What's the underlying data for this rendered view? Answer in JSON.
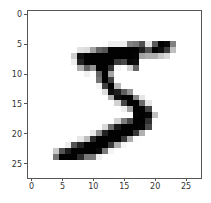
{
  "chart_data": {
    "type": "heatmap",
    "title": "",
    "xlabel": "",
    "ylabel": "",
    "colormap": "gray_r",
    "xlim": [
      -0.5,
      27.5
    ],
    "ylim": [
      27.5,
      -0.5
    ],
    "xticks": [
      0,
      5,
      10,
      15,
      20,
      25
    ],
    "yticks": [
      0,
      5,
      10,
      15,
      20,
      25
    ],
    "xtick_labels": [
      "0",
      "5",
      "10",
      "15",
      "20",
      "25"
    ],
    "ytick_labels": [
      "0",
      "5",
      "10",
      "15",
      "20",
      "25"
    ],
    "grid": false,
    "legend": null,
    "rows": 28,
    "cols": 28,
    "pixels": [
      [
        0,
        0,
        0,
        0,
        0,
        0,
        0,
        0,
        0,
        0,
        0,
        0,
        0,
        0,
        0,
        0,
        0,
        0,
        0,
        0,
        0,
        0,
        0,
        0,
        0,
        0,
        0,
        0
      ],
      [
        0,
        0,
        0,
        0,
        0,
        0,
        0,
        0,
        0,
        0,
        0,
        0,
        0,
        0,
        0,
        0,
        0,
        0,
        0,
        0,
        0,
        0,
        0,
        0,
        0,
        0,
        0,
        0
      ],
      [
        0,
        0,
        0,
        0,
        0,
        0,
        0,
        0,
        0,
        0,
        0,
        0,
        0,
        0,
        0,
        0,
        0,
        0,
        0,
        0,
        0,
        0,
        0,
        0,
        0,
        0,
        0,
        0
      ],
      [
        0,
        0,
        0,
        0,
        0,
        0,
        0,
        0,
        0,
        0,
        0,
        0,
        0,
        0,
        0,
        0,
        0,
        0,
        0,
        0,
        0,
        0,
        0,
        0,
        0,
        0,
        0,
        0
      ],
      [
        0,
        0,
        0,
        0,
        0,
        0,
        0,
        0,
        0,
        0,
        0,
        0,
        0,
        0,
        0,
        0,
        0,
        0,
        0,
        0,
        0,
        0,
        0,
        0,
        0,
        0,
        0,
        0
      ],
      [
        0,
        0,
        0,
        0,
        0,
        0,
        0,
        0,
        0,
        0,
        0,
        0,
        3,
        18,
        18,
        18,
        126,
        136,
        175,
        26,
        166,
        255,
        247,
        127,
        0,
        0,
        0,
        0
      ],
      [
        0,
        0,
        0,
        0,
        0,
        0,
        0,
        0,
        30,
        36,
        94,
        154,
        170,
        253,
        253,
        253,
        253,
        253,
        225,
        172,
        253,
        242,
        195,
        64,
        0,
        0,
        0,
        0
      ],
      [
        0,
        0,
        0,
        0,
        0,
        0,
        0,
        49,
        238,
        253,
        253,
        253,
        253,
        253,
        253,
        253,
        253,
        251,
        93,
        82,
        82,
        56,
        39,
        0,
        0,
        0,
        0,
        0
      ],
      [
        0,
        0,
        0,
        0,
        0,
        0,
        0,
        18,
        219,
        253,
        253,
        253,
        253,
        253,
        198,
        182,
        247,
        241,
        0,
        0,
        0,
        0,
        0,
        0,
        0,
        0,
        0,
        0
      ],
      [
        0,
        0,
        0,
        0,
        0,
        0,
        0,
        0,
        80,
        156,
        107,
        253,
        253,
        205,
        11,
        0,
        43,
        154,
        0,
        0,
        0,
        0,
        0,
        0,
        0,
        0,
        0,
        0
      ],
      [
        0,
        0,
        0,
        0,
        0,
        0,
        0,
        0,
        0,
        14,
        1,
        154,
        253,
        90,
        0,
        0,
        0,
        0,
        0,
        0,
        0,
        0,
        0,
        0,
        0,
        0,
        0,
        0
      ],
      [
        0,
        0,
        0,
        0,
        0,
        0,
        0,
        0,
        0,
        0,
        0,
        139,
        253,
        190,
        2,
        0,
        0,
        0,
        0,
        0,
        0,
        0,
        0,
        0,
        0,
        0,
        0,
        0
      ],
      [
        0,
        0,
        0,
        0,
        0,
        0,
        0,
        0,
        0,
        0,
        0,
        11,
        190,
        253,
        70,
        0,
        0,
        0,
        0,
        0,
        0,
        0,
        0,
        0,
        0,
        0,
        0,
        0
      ],
      [
        0,
        0,
        0,
        0,
        0,
        0,
        0,
        0,
        0,
        0,
        0,
        0,
        35,
        241,
        225,
        160,
        108,
        1,
        0,
        0,
        0,
        0,
        0,
        0,
        0,
        0,
        0,
        0
      ],
      [
        0,
        0,
        0,
        0,
        0,
        0,
        0,
        0,
        0,
        0,
        0,
        0,
        0,
        81,
        240,
        253,
        253,
        119,
        25,
        0,
        0,
        0,
        0,
        0,
        0,
        0,
        0,
        0
      ],
      [
        0,
        0,
        0,
        0,
        0,
        0,
        0,
        0,
        0,
        0,
        0,
        0,
        0,
        0,
        45,
        186,
        253,
        253,
        150,
        27,
        0,
        0,
        0,
        0,
        0,
        0,
        0,
        0
      ],
      [
        0,
        0,
        0,
        0,
        0,
        0,
        0,
        0,
        0,
        0,
        0,
        0,
        0,
        0,
        0,
        16,
        93,
        252,
        253,
        187,
        0,
        0,
        0,
        0,
        0,
        0,
        0,
        0
      ],
      [
        0,
        0,
        0,
        0,
        0,
        0,
        0,
        0,
        0,
        0,
        0,
        0,
        0,
        0,
        0,
        0,
        0,
        249,
        253,
        249,
        64,
        0,
        0,
        0,
        0,
        0,
        0,
        0
      ],
      [
        0,
        0,
        0,
        0,
        0,
        0,
        0,
        0,
        0,
        0,
        0,
        0,
        0,
        0,
        46,
        130,
        183,
        253,
        253,
        207,
        2,
        0,
        0,
        0,
        0,
        0,
        0,
        0
      ],
      [
        0,
        0,
        0,
        0,
        0,
        0,
        0,
        0,
        0,
        0,
        0,
        0,
        39,
        148,
        229,
        253,
        253,
        253,
        250,
        182,
        0,
        0,
        0,
        0,
        0,
        0,
        0,
        0
      ],
      [
        0,
        0,
        0,
        0,
        0,
        0,
        0,
        0,
        0,
        0,
        24,
        114,
        221,
        253,
        253,
        253,
        253,
        201,
        78,
        0,
        0,
        0,
        0,
        0,
        0,
        0,
        0,
        0
      ],
      [
        0,
        0,
        0,
        0,
        0,
        0,
        0,
        0,
        23,
        66,
        213,
        253,
        253,
        253,
        253,
        198,
        81,
        2,
        0,
        0,
        0,
        0,
        0,
        0,
        0,
        0,
        0,
        0
      ],
      [
        0,
        0,
        0,
        0,
        0,
        0,
        18,
        171,
        219,
        253,
        253,
        253,
        253,
        195,
        80,
        9,
        0,
        0,
        0,
        0,
        0,
        0,
        0,
        0,
        0,
        0,
        0,
        0
      ],
      [
        0,
        0,
        0,
        0,
        55,
        172,
        226,
        253,
        253,
        253,
        253,
        244,
        133,
        11,
        0,
        0,
        0,
        0,
        0,
        0,
        0,
        0,
        0,
        0,
        0,
        0,
        0,
        0
      ],
      [
        0,
        0,
        0,
        0,
        136,
        253,
        253,
        253,
        212,
        135,
        132,
        16,
        0,
        0,
        0,
        0,
        0,
        0,
        0,
        0,
        0,
        0,
        0,
        0,
        0,
        0,
        0,
        0
      ],
      [
        0,
        0,
        0,
        0,
        0,
        0,
        0,
        0,
        0,
        0,
        0,
        0,
        0,
        0,
        0,
        0,
        0,
        0,
        0,
        0,
        0,
        0,
        0,
        0,
        0,
        0,
        0,
        0
      ],
      [
        0,
        0,
        0,
        0,
        0,
        0,
        0,
        0,
        0,
        0,
        0,
        0,
        0,
        0,
        0,
        0,
        0,
        0,
        0,
        0,
        0,
        0,
        0,
        0,
        0,
        0,
        0,
        0
      ],
      [
        0,
        0,
        0,
        0,
        0,
        0,
        0,
        0,
        0,
        0,
        0,
        0,
        0,
        0,
        0,
        0,
        0,
        0,
        0,
        0,
        0,
        0,
        0,
        0,
        0,
        0,
        0,
        0
      ]
    ]
  },
  "colors": {
    "axis_spine": "#555555",
    "tick_label": "#333333",
    "background": "#ffffff"
  }
}
